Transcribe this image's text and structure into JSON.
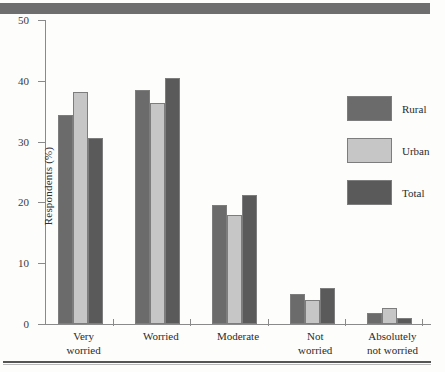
{
  "chart_data": {
    "type": "bar",
    "title": "",
    "xlabel": "",
    "ylabel": "Respondents (%)",
    "ylim": [
      0,
      50
    ],
    "yticks": [
      0,
      10,
      20,
      30,
      40,
      50
    ],
    "grid": false,
    "legend_position": "right",
    "categories": [
      "Very\nworried",
      "Worried",
      "Moderate",
      "Not\nworried",
      "Absolutely\nnot worried"
    ],
    "categories_flat": [
      "Very worried",
      "Worried",
      "Moderate",
      "Not worried",
      "Absolutely not worried"
    ],
    "series": [
      {
        "name": "Rural",
        "color": "#6b6b6b",
        "values": [
          34.4,
          38.5,
          19.6,
          5.0,
          1.8
        ]
      },
      {
        "name": "Urban",
        "color": "#c6c6c6",
        "values": [
          38.2,
          36.3,
          18.0,
          4.0,
          2.7
        ]
      },
      {
        "name": "Total",
        "color": "#5a5a5a",
        "values": [
          30.6,
          40.5,
          21.2,
          5.9,
          1.0
        ]
      }
    ]
  },
  "axis": {
    "tick_0": "0",
    "tick_10": "10",
    "tick_20": "20",
    "tick_30": "30",
    "tick_40": "40",
    "tick_50": "50",
    "y_title": "Respondents (%)"
  },
  "legend": {
    "items": [
      {
        "label": "Rural"
      },
      {
        "label": "Urban"
      },
      {
        "label": "Total"
      }
    ]
  },
  "colors": {
    "rural": "#6b6b6b",
    "urban": "#c6c6c6",
    "total": "#5a5a5a",
    "axis": "#8a8a8a",
    "band": "#6e6e6e",
    "text": "#2b2b2b"
  }
}
